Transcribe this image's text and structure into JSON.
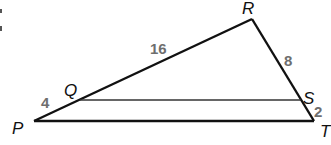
{
  "diagram": {
    "type": "triangle-with-parallel-segment",
    "colors": {
      "line": "#111111",
      "vertex_label": "#111111",
      "length_label": "#6e6e6e",
      "background": "#ffffff"
    },
    "vertices": {
      "P": {
        "label": "P",
        "x": 34,
        "y": 121
      },
      "Q": {
        "label": "Q",
        "x": 80,
        "y": 99
      },
      "R": {
        "label": "R",
        "x": 252,
        "y": 19
      },
      "S": {
        "label": "S",
        "x": 300,
        "y": 100
      },
      "T": {
        "label": "T",
        "x": 314,
        "y": 121
      }
    },
    "segments": [
      {
        "from": "P",
        "to": "R"
      },
      {
        "from": "R",
        "to": "T"
      },
      {
        "from": "P",
        "to": "T"
      },
      {
        "from": "Q",
        "to": "S"
      }
    ],
    "lengths": {
      "PQ": "4",
      "QR": "16",
      "RS": "8",
      "ST": "2"
    }
  }
}
